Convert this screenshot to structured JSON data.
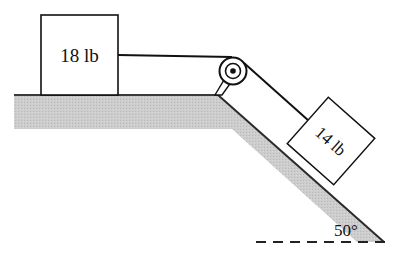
{
  "diagram": {
    "type": "physics-pulley-incline",
    "block_horizontal": {
      "label": "18 lb"
    },
    "block_incline": {
      "label": "14 lb"
    },
    "incline_angle": {
      "label": "50°"
    },
    "colors": {
      "ground_fill": "#c8c8c8",
      "ground_edge": "#3a3a3a",
      "line": "#111111",
      "background": "#ffffff"
    }
  }
}
